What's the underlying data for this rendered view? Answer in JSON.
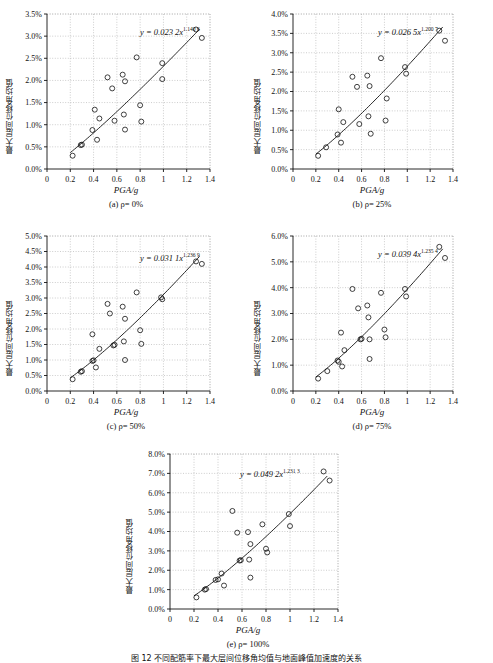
{
  "figure": {
    "caption": "图 12  不同配筋率下最大层间位移角均值与地面峰值加速度的关系",
    "ylabel": "最大层间位移角均值",
    "xlabel_italic": "PGA",
    "xlabel_unit": "/g"
  },
  "chart_data": [
    {
      "type": "scatter",
      "id": "a",
      "subcaption": "(a) ρ= 0%",
      "equation_text": "y = 0.023 2x",
      "equation_exponent": "1.140 6",
      "fit": {
        "a": 0.0232,
        "b": 1.1406,
        "units": "fraction"
      },
      "title": "",
      "xlabel": "PGA/g",
      "ylabel": "最大层间位移角均值",
      "xlim": [
        0,
        1.4
      ],
      "ylim": [
        0,
        3.5
      ],
      "xticks": [
        0,
        0.2,
        0.4,
        0.6,
        0.8,
        1,
        1.2,
        1.4
      ],
      "xticklabels": [
        "0",
        "0.2",
        "0.4",
        "0.6",
        "0.8",
        "1",
        "1.2",
        "1.4"
      ],
      "yticks": [
        0,
        0.5,
        1.0,
        1.5,
        2.0,
        2.5,
        3.0,
        3.5
      ],
      "yticklabels": [
        "0.0%",
        "0.5%",
        "1.0%",
        "1.5%",
        "2.0%",
        "2.5%",
        "3.0%",
        "3.5%"
      ],
      "grid": true,
      "points": [
        [
          0.22,
          0.3
        ],
        [
          0.29,
          0.54
        ],
        [
          0.3,
          0.55
        ],
        [
          0.39,
          0.88
        ],
        [
          0.41,
          1.34
        ],
        [
          0.43,
          0.66
        ],
        [
          0.45,
          1.14
        ],
        [
          0.52,
          2.07
        ],
        [
          0.56,
          1.82
        ],
        [
          0.58,
          1.09
        ],
        [
          0.65,
          2.13
        ],
        [
          0.66,
          1.23
        ],
        [
          0.67,
          1.98
        ],
        [
          0.67,
          0.89
        ],
        [
          0.77,
          2.52
        ],
        [
          0.8,
          1.44
        ],
        [
          0.81,
          1.07
        ],
        [
          0.99,
          2.39
        ],
        [
          0.99,
          2.03
        ],
        [
          1.28,
          3.15
        ],
        [
          1.33,
          2.96
        ]
      ]
    },
    {
      "type": "scatter",
      "id": "b",
      "subcaption": "(b) ρ= 25%",
      "equation_text": "y = 0.026 5x",
      "equation_exponent": "1.200 7",
      "fit": {
        "a": 0.0265,
        "b": 1.2007,
        "units": "fraction"
      },
      "title": "",
      "xlabel": "PGA/g",
      "ylabel": "最大层间位移角均值",
      "xlim": [
        0,
        1.4
      ],
      "ylim": [
        0,
        4.0
      ],
      "xticks": [
        0,
        0.2,
        0.4,
        0.6,
        0.8,
        1,
        1.2,
        1.4
      ],
      "xticklabels": [
        "0",
        "0.2",
        "0.4",
        "0.6",
        "0.8",
        "1",
        "1.2",
        "1.4"
      ],
      "yticks": [
        0,
        0.5,
        1.0,
        1.5,
        2.0,
        2.5,
        3.0,
        3.5,
        4.0
      ],
      "yticklabels": [
        "0.0%",
        "0.5%",
        "1.0%",
        "1.5%",
        "2.0%",
        "2.5%",
        "3.0%",
        "3.5%",
        "4.0%"
      ],
      "grid": true,
      "points": [
        [
          0.22,
          0.34
        ],
        [
          0.29,
          0.56
        ],
        [
          0.39,
          0.89
        ],
        [
          0.4,
          1.54
        ],
        [
          0.42,
          0.68
        ],
        [
          0.44,
          1.21
        ],
        [
          0.52,
          2.38
        ],
        [
          0.56,
          2.12
        ],
        [
          0.58,
          1.16
        ],
        [
          0.65,
          2.41
        ],
        [
          0.66,
          1.36
        ],
        [
          0.67,
          2.14
        ],
        [
          0.68,
          0.91
        ],
        [
          0.77,
          2.86
        ],
        [
          0.81,
          1.25
        ],
        [
          0.82,
          1.82
        ],
        [
          0.98,
          2.63
        ],
        [
          0.99,
          2.46
        ],
        [
          1.28,
          3.57
        ],
        [
          1.33,
          3.31
        ]
      ]
    },
    {
      "type": "scatter",
      "id": "c",
      "subcaption": "(c) ρ= 50%",
      "equation_text": "y = 0.031 1x",
      "equation_exponent": "1.236 9",
      "fit": {
        "a": 0.0311,
        "b": 1.2369,
        "units": "fraction"
      },
      "title": "",
      "xlabel": "PGA/g",
      "ylabel": "最大层间位移角均值",
      "xlim": [
        0,
        1.4
      ],
      "ylim": [
        0,
        5.0
      ],
      "xticks": [
        0,
        0.2,
        0.4,
        0.6,
        0.8,
        1,
        1.2,
        1.4
      ],
      "xticklabels": [
        "0",
        "0.2",
        "0.4",
        "0.6",
        "0.8",
        "1",
        "1.2",
        "1.4"
      ],
      "yticks": [
        0,
        0.5,
        1.0,
        1.5,
        2.0,
        2.5,
        3.0,
        3.5,
        4.0,
        4.5,
        5.0
      ],
      "yticklabels": [
        "0.0%",
        "0.5%",
        "1.0%",
        "1.5%",
        "2.0%",
        "2.5%",
        "3.0%",
        "3.5%",
        "4.0%",
        "4.5%",
        "5.0%"
      ],
      "grid": true,
      "points": [
        [
          0.22,
          0.38
        ],
        [
          0.29,
          0.62
        ],
        [
          0.3,
          0.64
        ],
        [
          0.39,
          0.97
        ],
        [
          0.39,
          1.83
        ],
        [
          0.4,
          0.99
        ],
        [
          0.42,
          0.76
        ],
        [
          0.45,
          1.36
        ],
        [
          0.52,
          2.81
        ],
        [
          0.54,
          2.5
        ],
        [
          0.57,
          1.47
        ],
        [
          0.58,
          1.49
        ],
        [
          0.65,
          2.72
        ],
        [
          0.66,
          1.6
        ],
        [
          0.67,
          2.33
        ],
        [
          0.67,
          1.0
        ],
        [
          0.77,
          3.18
        ],
        [
          0.8,
          1.96
        ],
        [
          0.81,
          1.52
        ],
        [
          0.98,
          3.02
        ],
        [
          0.99,
          2.96
        ],
        [
          1.28,
          4.18
        ],
        [
          1.33,
          4.1
        ]
      ]
    },
    {
      "type": "scatter",
      "id": "d",
      "subcaption": "(d) ρ= 75%",
      "equation_text": "y = 0.039 4x",
      "equation_exponent": "1.235 4",
      "fit": {
        "a": 0.0394,
        "b": 1.2354,
        "units": "fraction"
      },
      "title": "",
      "xlabel": "PGA/g",
      "ylabel": "最大层间位移角均值",
      "xlim": [
        0,
        1.4
      ],
      "ylim": [
        0,
        6.0
      ],
      "xticks": [
        0,
        0.2,
        0.4,
        0.6,
        0.8,
        1,
        1.2,
        1.4
      ],
      "xticklabels": [
        "0",
        "0.2",
        "0.4",
        "0.6",
        "0.8",
        "1",
        "1.2",
        "1.4"
      ],
      "yticks": [
        0,
        1.0,
        2.0,
        3.0,
        4.0,
        5.0,
        6.0
      ],
      "yticklabels": [
        "0.0%",
        "1.0%",
        "2.0%",
        "3.0%",
        "4.0%",
        "5.0%",
        "6.0%"
      ],
      "grid": true,
      "points": [
        [
          0.22,
          0.48
        ],
        [
          0.3,
          0.77
        ],
        [
          0.39,
          1.18
        ],
        [
          0.4,
          1.13
        ],
        [
          0.42,
          2.26
        ],
        [
          0.43,
          0.95
        ],
        [
          0.45,
          1.58
        ],
        [
          0.52,
          3.95
        ],
        [
          0.57,
          3.2
        ],
        [
          0.59,
          2.0
        ],
        [
          0.6,
          2.02
        ],
        [
          0.65,
          3.31
        ],
        [
          0.66,
          2.85
        ],
        [
          0.67,
          2.0
        ],
        [
          0.67,
          1.24
        ],
        [
          0.77,
          3.8
        ],
        [
          0.8,
          2.38
        ],
        [
          0.81,
          2.08
        ],
        [
          0.98,
          3.95
        ],
        [
          0.99,
          3.66
        ],
        [
          1.28,
          5.58
        ],
        [
          1.33,
          5.15
        ]
      ]
    },
    {
      "type": "scatter",
      "id": "e",
      "subcaption": "(e) ρ= 100%",
      "equation_text": "y = 0.049 2x",
      "equation_exponent": "1.231 3",
      "fit": {
        "a": 0.0492,
        "b": 1.2313,
        "units": "fraction"
      },
      "title": "",
      "xlabel": "PGA/g",
      "ylabel": "最大层间位移角均值",
      "xlim": [
        0,
        1.4
      ],
      "ylim": [
        0,
        8.0
      ],
      "xticks": [
        0,
        0.2,
        0.4,
        0.6,
        0.8,
        1,
        1.2,
        1.4
      ],
      "xticklabels": [
        "0",
        "0.2",
        "0.4",
        "0.6",
        "0.8",
        "1",
        "1.2",
        "1.4"
      ],
      "yticks": [
        0,
        1.0,
        2.0,
        3.0,
        4.0,
        5.0,
        6.0,
        7.0,
        8.0
      ],
      "yticklabels": [
        "0.0%",
        "1.0%",
        "2.0%",
        "3.0%",
        "4.0%",
        "5.0%",
        "6.0%",
        "7.0%",
        "8.0%"
      ],
      "grid": true,
      "points": [
        [
          0.22,
          0.6
        ],
        [
          0.29,
          1.0
        ],
        [
          0.3,
          1.03
        ],
        [
          0.38,
          1.5
        ],
        [
          0.4,
          1.53
        ],
        [
          0.43,
          1.83
        ],
        [
          0.45,
          1.21
        ],
        [
          0.52,
          5.06
        ],
        [
          0.56,
          3.94
        ],
        [
          0.58,
          2.5
        ],
        [
          0.59,
          2.52
        ],
        [
          0.65,
          3.97
        ],
        [
          0.66,
          2.55
        ],
        [
          0.67,
          3.35
        ],
        [
          0.67,
          1.62
        ],
        [
          0.77,
          4.37
        ],
        [
          0.8,
          3.11
        ],
        [
          0.81,
          2.92
        ],
        [
          0.99,
          4.9
        ],
        [
          1.0,
          4.28
        ],
        [
          1.28,
          7.1
        ],
        [
          1.33,
          6.63
        ]
      ]
    }
  ]
}
